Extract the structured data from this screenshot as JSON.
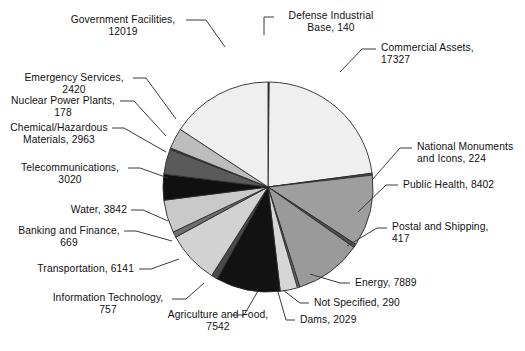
{
  "chart_data": {
    "type": "pie",
    "title": "",
    "subtitle": "",
    "xlabel": "",
    "ylabel": "",
    "legend_position": "callout-labels",
    "grid": false,
    "total": 76949,
    "center": {
      "x": 268,
      "y": 187
    },
    "radius": 105,
    "start_angle_deg": -90,
    "direction": "clockwise",
    "categories": [
      "Defense Industrial Base",
      "Commercial Assets",
      "National Monuments and Icons",
      "Public Health",
      "Postal and Shipping",
      "Energy",
      "Not Specified",
      "Dams",
      "Agriculture and Food",
      "Information Technology",
      "Transportation",
      "Banking and Finance",
      "Water",
      "Telecommunications",
      "Chemical/Hazardous Materials",
      "Nuclear Power Plants",
      "Emergency Services",
      "Government Facilities"
    ],
    "values": [
      140,
      17327,
      224,
      8402,
      417,
      7889,
      290,
      2029,
      7542,
      757,
      6141,
      669,
      3842,
      3020,
      2963,
      178,
      2420,
      12019
    ],
    "colors": [
      "#4a4a4a",
      "#efefef",
      "#4a4a4a",
      "#9e9e9e",
      "#4f4f4f",
      "#9a9a9a",
      "#6a6a6a",
      "#d6d6d6",
      "#121212",
      "#4a4a4a",
      "#d2d2d2",
      "#6e6e6e",
      "#c9c9c9",
      "#101010",
      "#5a5a5a",
      "#3d3d3d",
      "#bdbdbd",
      "#efefef"
    ],
    "slices": [
      {
        "label": "Defense Industrial Base",
        "value": 140,
        "text": "Defense Industrial\nBase, 140",
        "color": "#4a4a4a"
      },
      {
        "label": "Commercial Assets",
        "value": 17327,
        "text": "Commercial Assets,\n17327",
        "color": "#efefef"
      },
      {
        "label": "National Monuments and Icons",
        "value": 224,
        "text": "National Monuments\nand Icons, 224",
        "color": "#4a4a4a"
      },
      {
        "label": "Public Health",
        "value": 8402,
        "text": "Public Health, 8402",
        "color": "#9e9e9e"
      },
      {
        "label": "Postal and Shipping",
        "value": 417,
        "text": "Postal and Shipping,\n417",
        "color": "#4f4f4f"
      },
      {
        "label": "Energy",
        "value": 7889,
        "text": "Energy, 7889",
        "color": "#9a9a9a"
      },
      {
        "label": "Not Specified",
        "value": 290,
        "text": "Not Specified, 290",
        "color": "#6a6a6a"
      },
      {
        "label": "Dams",
        "value": 2029,
        "text": "Dams, 2029",
        "color": "#d6d6d6"
      },
      {
        "label": "Agriculture and Food",
        "value": 7542,
        "text": "Agriculture and Food,\n7542",
        "color": "#121212"
      },
      {
        "label": "Information Technology",
        "value": 757,
        "text": "Information Technology,\n757",
        "color": "#4a4a4a"
      },
      {
        "label": "Transportation",
        "value": 6141,
        "text": "Transportation, 6141",
        "color": "#d2d2d2"
      },
      {
        "label": "Banking and Finance",
        "value": 669,
        "text": "Banking and Finance,\n669",
        "color": "#6e6e6e"
      },
      {
        "label": "Water",
        "value": 3842,
        "text": "Water, 3842",
        "color": "#c9c9c9"
      },
      {
        "label": "Telecommunications",
        "value": 3020,
        "text": "Telecommunications,\n3020",
        "color": "#101010"
      },
      {
        "label": "Chemical/Hazardous Materials",
        "value": 2963,
        "text": "Chemical/Hazardous\nMaterials, 2963",
        "color": "#5a5a5a"
      },
      {
        "label": "Nuclear Power Plants",
        "value": 178,
        "text": "Nuclear Power Plants,\n178",
        "color": "#3d3d3d"
      },
      {
        "label": "Emergency Services",
        "value": 2420,
        "text": "Emergency Services,\n2420",
        "color": "#bdbdbd"
      },
      {
        "label": "Government Facilities",
        "value": 12019,
        "text": "Government Facilities,\n12019",
        "color": "#efefef"
      }
    ]
  },
  "labels": {
    "government_facilities": "Government Facilities,\n12019",
    "defense_industrial_base": "Defense Industrial\nBase, 140",
    "commercial_assets": "Commercial Assets,\n17327",
    "national_monuments": "National Monuments\nand Icons, 224",
    "public_health": "Public Health, 8402",
    "postal_and_shipping": "Postal and Shipping,\n417",
    "energy": "Energy, 7889",
    "not_specified": "Not Specified, 290",
    "dams": "Dams, 2029",
    "agriculture_and_food": "Agriculture and Food,\n7542",
    "information_technology": "Information Technology,\n757",
    "transportation": "Transportation, 6141",
    "banking_and_finance": "Banking and Finance,\n669",
    "water": "Water, 3842",
    "telecommunications": "Telecommunications,\n3020",
    "chemical_hazardous": "Chemical/Hazardous\nMaterials, 2963",
    "nuclear_power_plants": "Nuclear Power Plants,\n178",
    "emergency_services": "Emergency Services,\n2420"
  }
}
